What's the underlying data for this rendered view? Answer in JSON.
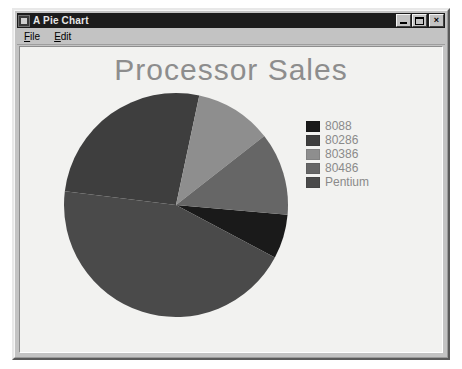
{
  "window": {
    "title": "A Pie Chart",
    "icon": "music-note-icon",
    "controls": {
      "minimize": "minimize-icon",
      "maximize": "maximize-icon",
      "close": "close-icon"
    }
  },
  "menu": {
    "items": [
      {
        "label": "File",
        "accel": "F"
      },
      {
        "label": "Edit",
        "accel": "E"
      }
    ]
  },
  "colors": {
    "title_bar": "#1c1c1c",
    "window_face": "#c3c3c3",
    "client_bg": "#f2f2f0",
    "chart_title": "#8d8d8d",
    "legend_text": "#8a8a8a"
  },
  "chart_data": {
    "type": "pie",
    "title": "Processor Sales",
    "xlabel": "",
    "ylabel": "",
    "legend_position": "right",
    "start_angle_deg": 12,
    "direction": "clockwise",
    "categories": [
      "8088",
      "80286",
      "80386",
      "80486",
      "Pentium"
    ],
    "values": [
      6.4,
      26.4,
      11.1,
      11.9,
      44.2
    ],
    "colors": [
      "#1a1a1a",
      "#3e3e3e",
      "#8e8e8e",
      "#666666",
      "#4a4a4a"
    ],
    "slices": [
      {
        "label": "8088",
        "value": 6.4,
        "color": "#1a1a1a",
        "start_deg": 95,
        "end_deg": 118
      },
      {
        "label": "80286",
        "value": 26.4,
        "color": "#3e3e3e",
        "start_deg": 277,
        "end_deg": 372
      },
      {
        "label": "80386",
        "value": 11.1,
        "color": "#8e8e8e",
        "start_deg": 12,
        "end_deg": 52
      },
      {
        "label": "80486",
        "value": 11.9,
        "color": "#666666",
        "start_deg": 52,
        "end_deg": 95
      },
      {
        "label": "Pentium",
        "value": 44.2,
        "color": "#4a4a4a",
        "start_deg": 118,
        "end_deg": 277
      }
    ]
  },
  "legend": {
    "entries": [
      {
        "label": "8088",
        "color": "#1a1a1a"
      },
      {
        "label": "80286",
        "color": "#3e3e3e"
      },
      {
        "label": "80386",
        "color": "#8e8e8e"
      },
      {
        "label": "80486",
        "color": "#666666"
      },
      {
        "label": "Pentium",
        "color": "#4a4a4a"
      }
    ]
  }
}
